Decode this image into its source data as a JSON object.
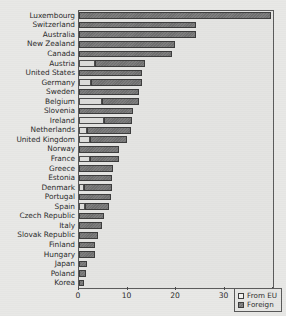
{
  "chart_data": {
    "type": "bar",
    "orientation": "horizontal",
    "stacked": true,
    "title": "",
    "subtitle": "",
    "xlabel": "",
    "ylabel": "",
    "xlim": [
      0,
      40
    ],
    "xticks": [
      0,
      10,
      20,
      30,
      40
    ],
    "xtick_labels": [
      "0",
      "10",
      "20",
      "30",
      "40"
    ],
    "grid": false,
    "legend_position": "bottom-right-inside",
    "categories": [
      "Luxembourg",
      "Switzerland",
      "Australia",
      "New Zealand",
      "Canada",
      "Austria",
      "United States",
      "Germany",
      "Sweden",
      "Belgium",
      "Slovenia",
      "Ireland",
      "Netherlands",
      "United Kingdom",
      "Norway",
      "France",
      "Greece",
      "Estonia",
      "Denmark",
      "Portugal",
      "Spain",
      "Czech Republic",
      "Italy",
      "Slovak Republic",
      "Finland",
      "Hungary",
      "Japan",
      "Poland",
      "Korea"
    ],
    "series": [
      {
        "name": "From EU",
        "color": "#dcdcda",
        "values": [
          0.0,
          0.0,
          0.0,
          0.0,
          0.0,
          3.4,
          0.0,
          2.4,
          0.0,
          4.8,
          0.0,
          5.2,
          1.6,
          2.2,
          0.0,
          2.3,
          0.0,
          0.0,
          1.0,
          0.0,
          1.3,
          0.0,
          0.0,
          0.0,
          0.0,
          0.0,
          0.0,
          0.0,
          0.0
        ]
      },
      {
        "name": "Foreign",
        "color": "#6f6f6f",
        "values": [
          39.5,
          24.2,
          24.1,
          19.7,
          19.2,
          10.2,
          13.0,
          10.5,
          12.4,
          7.6,
          11.2,
          5.8,
          9.1,
          7.6,
          8.3,
          5.9,
          7.0,
          6.9,
          5.8,
          6.5,
          4.9,
          5.2,
          4.7,
          4.0,
          3.4,
          3.2,
          1.7,
          1.5,
          1.1
        ]
      }
    ],
    "totals": [
      39.5,
      24.2,
      24.1,
      19.7,
      19.2,
      13.6,
      13.0,
      12.9,
      12.4,
      12.4,
      11.2,
      11.0,
      10.7,
      9.8,
      8.3,
      8.2,
      7.0,
      6.9,
      6.8,
      6.5,
      6.2,
      5.2,
      4.7,
      4.0,
      3.4,
      3.2,
      1.7,
      1.5,
      1.1
    ]
  },
  "legend": {
    "entries": [
      {
        "label": "From EU",
        "swatch": "light-square-swatch"
      },
      {
        "label": "Foreign",
        "swatch": "dark-square-swatch"
      }
    ]
  }
}
